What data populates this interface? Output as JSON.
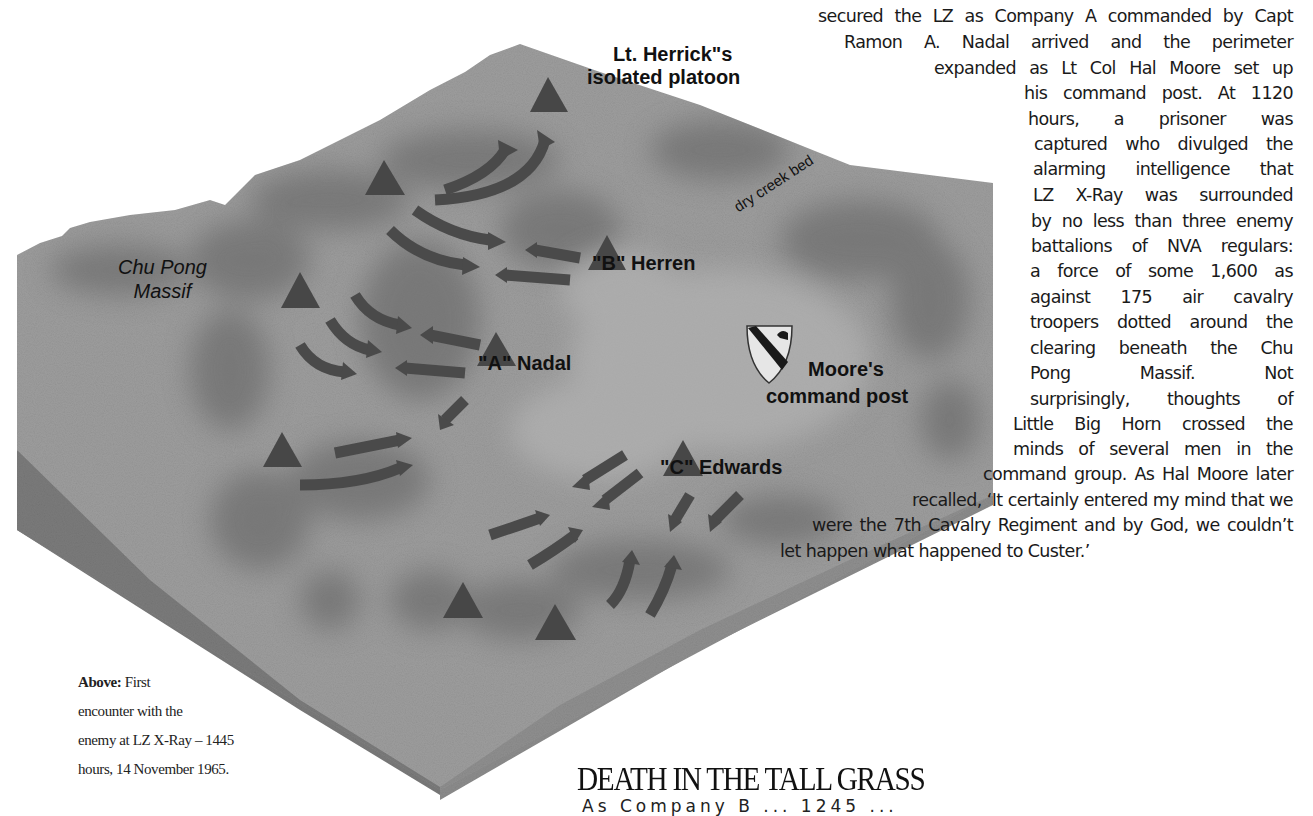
{
  "map": {
    "title_label": [
      "Lt. Herrick\"s",
      "isolated platoon"
    ],
    "massif_label": [
      "Chu Pong",
      "Massif"
    ],
    "creek_label": "dry creek bed",
    "company_b_label": "\"B\" Herren",
    "company_a_label": "\"A\" Nadal",
    "company_c_label": "\"C\" Edwards",
    "command_post_label": [
      "Moore's",
      "command post"
    ],
    "icons": [
      "unit-triangle-icon",
      "attack-arrow-icon",
      "cavalry-shield-icon"
    ],
    "colors": {
      "terrain": "#9a9a9a",
      "terrain_dark": "#6f6f6f",
      "side_left": "#7d7d7d",
      "side_front": "#8e8e8e",
      "markers": "#474747"
    }
  },
  "article": {
    "lines": [
      "secured the LZ as Company A commanded by Capt",
      "Ramon A. Nadal arrived and the perimeter",
      "expanded as Lt Col Hal Moore set up",
      "his command post. At 1120",
      "hours, a prisoner was",
      "captured who divulged the",
      "alarming intelligence that",
      "LZ X-Ray was surrounded",
      "by no less than three enemy",
      "battalions of NVA regulars:",
      "a force of some 1,600 as",
      "against 175 air cavalry",
      "troopers dotted around the",
      "clearing beneath the Chu",
      "Pong Massif. Not",
      "surprisingly, thoughts of",
      "Little Big Horn crossed the",
      "minds of several men in the",
      "command group. As Hal Moore later",
      "recalled, ‘It certainly entered my mind that we",
      "were the 7th Cavalry Regiment and by God, we couldn’t",
      "let happen what happened to Custer.’"
    ],
    "section_heading": "DEATH IN THE TALL GRASS",
    "cutoff_line": "As Company B ... 1245 ..."
  },
  "caption": {
    "lead": "Above:",
    "lines": [
      "First",
      "encounter with the",
      "enemy at LZ X-Ray – 1445",
      "hours, 14 November 1965."
    ]
  }
}
